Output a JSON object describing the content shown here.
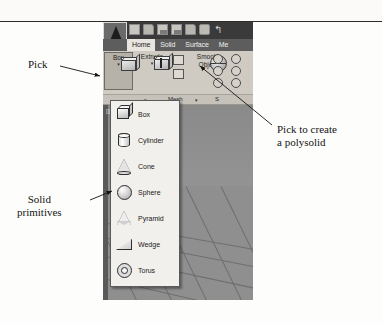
{
  "figure": {
    "application": "AutoCAD Ribbon",
    "app_button_label": "A"
  },
  "quick_access_toolbar": {
    "icons": [
      {
        "name": "new-file-icon",
        "label": "New"
      },
      {
        "name": "open-folder-icon",
        "label": "Open"
      },
      {
        "name": "save-icon",
        "label": "Save"
      },
      {
        "name": "save-as-icon",
        "label": "Save As"
      },
      {
        "name": "plot-preview-icon",
        "label": "Plot Preview"
      },
      {
        "name": "print-icon",
        "label": "Plot"
      },
      {
        "name": "undo-icon",
        "label": "Undo",
        "glyph": "↰"
      }
    ]
  },
  "ribbon": {
    "tabs": [
      {
        "label": "Home",
        "active": true
      },
      {
        "label": "Solid",
        "active": false
      },
      {
        "label": "Surface",
        "active": false
      },
      {
        "label": "Me",
        "active": false
      }
    ],
    "buttons": {
      "box": {
        "label": "Box",
        "caret": "▾"
      },
      "extrude": {
        "label": "Extrude",
        "caret": "▾"
      },
      "smooth_object": {
        "label": "Smooth\nObject"
      }
    },
    "panel_labels": [
      {
        "label": "Mesh"
      },
      {
        "label": "S"
      }
    ],
    "panel_caret": "▾"
  },
  "dropdown": {
    "title": "Box flyout",
    "items": [
      {
        "label": "Box",
        "icon": "box-primitive-icon"
      },
      {
        "label": "Cylinder",
        "icon": "cylinder-primitive-icon"
      },
      {
        "label": "Cone",
        "icon": "cone-primitive-icon"
      },
      {
        "label": "Sphere",
        "icon": "sphere-primitive-icon"
      },
      {
        "label": "Pyramid",
        "icon": "pyramid-primitive-icon"
      },
      {
        "label": "Wedge",
        "icon": "wedge-primitive-icon"
      },
      {
        "label": "Torus",
        "icon": "torus-primitive-icon"
      }
    ]
  },
  "viewport": {
    "label": "[][Realistic]"
  },
  "annotations": {
    "pick": "Pick",
    "solid_primitives": "Solid\nprimitives",
    "polysolid": "Pick to create\na polysolid"
  },
  "colors": {
    "ribbon_bg": "#d4d0c8",
    "tab_bar": "#5d5d5d",
    "active_tab": "#e9e6df",
    "viewport": "#8e8e8e",
    "dropdown_bg": "#f2f0ec",
    "text": "#141414"
  }
}
